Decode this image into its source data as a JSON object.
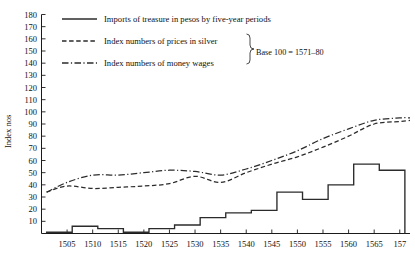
{
  "chart_data": {
    "type": "line",
    "title": "",
    "xlabel": "",
    "ylabel": "Index nos",
    "ylim": [
      0,
      180
    ],
    "xlim": [
      1500,
      1572
    ],
    "grid": false,
    "legend_position": "top-left-inside",
    "y_ticks": [
      10,
      20,
      30,
      40,
      50,
      60,
      70,
      80,
      90,
      100,
      110,
      120,
      130,
      140,
      150,
      160,
      170,
      180
    ],
    "x_ticks": [
      1505,
      1510,
      1515,
      1520,
      1525,
      1530,
      1535,
      1540,
      1545,
      1550,
      1555,
      1560,
      1565,
      1570
    ],
    "x_tick_labels": [
      "1505",
      "1510",
      "1515",
      "1520",
      "1525",
      "1530",
      "1535",
      "1540",
      "1545",
      "1550",
      "1555",
      "1560",
      "1565",
      "157"
    ],
    "annotations": [
      "Base 100 = 1571–80"
    ],
    "series": [
      {
        "name": "Imports of treasure in pesos by five-year periods",
        "style": "solid-step",
        "periods": [
          "1501-05",
          "1506-10",
          "1511-15",
          "1516-20",
          "1521-25",
          "1526-30",
          "1531-35",
          "1536-40",
          "1541-45",
          "1546-50",
          "1551-55",
          "1556-60",
          "1561-65",
          "1566-70"
        ],
        "x_starts": [
          1501,
          1506,
          1511,
          1516,
          1521,
          1526,
          1531,
          1536,
          1541,
          1546,
          1551,
          1556,
          1561,
          1566
        ],
        "values": [
          1,
          6,
          4,
          1,
          4,
          7,
          13,
          17,
          19,
          34,
          28,
          40,
          57,
          52
        ]
      },
      {
        "name": "Index numbers of prices in silver",
        "style": "dashed",
        "x": [
          1501,
          1505,
          1510,
          1515,
          1520,
          1525,
          1530,
          1535,
          1540,
          1545,
          1550,
          1555,
          1560,
          1565,
          1570,
          1572
        ],
        "values": [
          34,
          39,
          37,
          38,
          39,
          41,
          47,
          42,
          50,
          57,
          63,
          71,
          80,
          90,
          92,
          93
        ]
      },
      {
        "name": "Index numbers of money wages",
        "style": "dash-dot",
        "x": [
          1501,
          1505,
          1510,
          1515,
          1520,
          1525,
          1530,
          1535,
          1540,
          1545,
          1550,
          1555,
          1560,
          1565,
          1570,
          1572
        ],
        "values": [
          34,
          42,
          48,
          48,
          50,
          52,
          51,
          48,
          53,
          60,
          68,
          78,
          86,
          93,
          95,
          95
        ]
      }
    ]
  },
  "axis": {
    "y_label": "Index nos"
  },
  "legend": {
    "items": [
      {
        "label": "Imports of treasure in pesos by five-year periods",
        "key": "solid-line-key"
      },
      {
        "label": "Index numbers of prices in silver",
        "key": "dashed-line-key"
      },
      {
        "label": "Index numbers of money wages",
        "key": "dash-dot-line-key"
      }
    ],
    "brace_note": "Base 100 = 1571–80"
  }
}
